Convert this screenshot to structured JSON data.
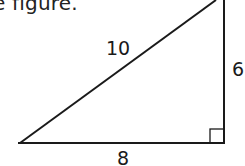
{
  "caption": "e figure.",
  "triangle": {
    "hypotenuse_label": "10",
    "vertical_leg_label": "6",
    "horizontal_leg_label": "8",
    "right_angle_marker": true,
    "stroke_color": "#1a1a1a"
  }
}
